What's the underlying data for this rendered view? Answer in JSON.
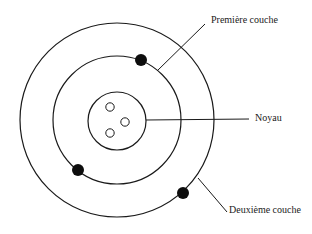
{
  "diagram": {
    "type": "atom-model",
    "center": [
      117,
      120
    ],
    "colors": {
      "stroke": "#1a1a1a",
      "electron": "#0d0d0d",
      "background": "#ffffff"
    },
    "shells": [
      {
        "name": "nucleus",
        "r": 29
      },
      {
        "name": "first-shell",
        "r": 64
      },
      {
        "name": "second-shell",
        "r": 97
      }
    ],
    "nucleons": [
      [
        110,
        107
      ],
      [
        125,
        122
      ],
      [
        110,
        133
      ]
    ],
    "electrons": [
      [
        141,
        60
      ],
      [
        78,
        170
      ],
      [
        183,
        193
      ]
    ],
    "labels": {
      "premiere_couche": "Première couche",
      "noyau": "Noyau",
      "deuxieme_couche": "Deuxième couche"
    }
  }
}
